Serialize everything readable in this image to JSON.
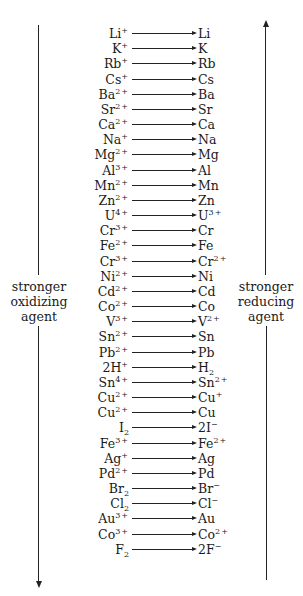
{
  "diagram": {
    "type": "reduction-potential-series",
    "left_axis": {
      "label_lines": [
        "stronger",
        "oxidizing",
        "agent"
      ],
      "direction": "down"
    },
    "right_axis": {
      "label_lines": [
        "stronger",
        "reducing",
        "agent"
      ],
      "direction": "up"
    },
    "reactions": [
      {
        "ox": "Li",
        "ox_sup": "+",
        "ox_sub": "",
        "red": "Li",
        "red_sup": "",
        "red_sub": ""
      },
      {
        "ox": "K",
        "ox_sup": "+",
        "ox_sub": "",
        "red": "K",
        "red_sup": "",
        "red_sub": ""
      },
      {
        "ox": "Rb",
        "ox_sup": "+",
        "ox_sub": "",
        "red": "Rb",
        "red_sup": "",
        "red_sub": ""
      },
      {
        "ox": "Cs",
        "ox_sup": "+",
        "ox_sub": "",
        "red": "Cs",
        "red_sup": "",
        "red_sub": ""
      },
      {
        "ox": "Ba",
        "ox_sup": "2+",
        "ox_sub": "",
        "red": "Ba",
        "red_sup": "",
        "red_sub": ""
      },
      {
        "ox": "Sr",
        "ox_sup": "2+",
        "ox_sub": "",
        "red": "Sr",
        "red_sup": "",
        "red_sub": ""
      },
      {
        "ox": "Ca",
        "ox_sup": "2+",
        "ox_sub": "",
        "red": "Ca",
        "red_sup": "",
        "red_sub": ""
      },
      {
        "ox": "Na",
        "ox_sup": "+",
        "ox_sub": "",
        "red": "Na",
        "red_sup": "",
        "red_sub": ""
      },
      {
        "ox": "Mg",
        "ox_sup": "2+",
        "ox_sub": "",
        "red": "Mg",
        "red_sup": "",
        "red_sub": ""
      },
      {
        "ox": "Al",
        "ox_sup": "3+",
        "ox_sub": "",
        "red": "Al",
        "red_sup": "",
        "red_sub": ""
      },
      {
        "ox": "Mn",
        "ox_sup": "2+",
        "ox_sub": "",
        "red": "Mn",
        "red_sup": "",
        "red_sub": ""
      },
      {
        "ox": "Zn",
        "ox_sup": "2+",
        "ox_sub": "",
        "red": "Zn",
        "red_sup": "",
        "red_sub": ""
      },
      {
        "ox": "U",
        "ox_sup": "4+",
        "ox_sub": "",
        "red": "U",
        "red_sup": "3+",
        "red_sub": ""
      },
      {
        "ox": "Cr",
        "ox_sup": "3+",
        "ox_sub": "",
        "red": "Cr",
        "red_sup": "",
        "red_sub": ""
      },
      {
        "ox": "Fe",
        "ox_sup": "2+",
        "ox_sub": "",
        "red": "Fe",
        "red_sup": "",
        "red_sub": ""
      },
      {
        "ox": "Cr",
        "ox_sup": "3+",
        "ox_sub": "",
        "red": "Cr",
        "red_sup": "2+",
        "red_sub": ""
      },
      {
        "ox": "Ni",
        "ox_sup": "2+",
        "ox_sub": "",
        "red": "Ni",
        "red_sup": "",
        "red_sub": ""
      },
      {
        "ox": "Cd",
        "ox_sup": "2+",
        "ox_sub": "",
        "red": "Cd",
        "red_sup": "",
        "red_sub": ""
      },
      {
        "ox": "Co",
        "ox_sup": "2+",
        "ox_sub": "",
        "red": "Co",
        "red_sup": "",
        "red_sub": ""
      },
      {
        "ox": "V",
        "ox_sup": "3+",
        "ox_sub": "",
        "red": "V",
        "red_sup": "2+",
        "red_sub": ""
      },
      {
        "ox": "Sn",
        "ox_sup": "2+",
        "ox_sub": "",
        "red": "Sn",
        "red_sup": "",
        "red_sub": ""
      },
      {
        "ox": "Pb",
        "ox_sup": "2+",
        "ox_sub": "",
        "red": "Pb",
        "red_sup": "",
        "red_sub": ""
      },
      {
        "ox": "2H",
        "ox_sup": "+",
        "ox_sub": "",
        "red": "H",
        "red_sup": "",
        "red_sub": "2"
      },
      {
        "ox": "Sn",
        "ox_sup": "4+",
        "ox_sub": "",
        "red": "Sn",
        "red_sup": "2+",
        "red_sub": ""
      },
      {
        "ox": "Cu",
        "ox_sup": "2+",
        "ox_sub": "",
        "red": "Cu",
        "red_sup": "+",
        "red_sub": ""
      },
      {
        "ox": "Cu",
        "ox_sup": "2+",
        "ox_sub": "",
        "red": "Cu",
        "red_sup": "",
        "red_sub": ""
      },
      {
        "ox": "I",
        "ox_sup": "",
        "ox_sub": "2",
        "red": "2I",
        "red_sup": "−",
        "red_sub": ""
      },
      {
        "ox": "Fe",
        "ox_sup": "3+",
        "ox_sub": "",
        "red": "Fe",
        "red_sup": "2+",
        "red_sub": ""
      },
      {
        "ox": "Ag",
        "ox_sup": "+",
        "ox_sub": "",
        "red": "Ag",
        "red_sup": "",
        "red_sub": ""
      },
      {
        "ox": "Pd",
        "ox_sup": "2+",
        "ox_sub": "",
        "red": "Pd",
        "red_sup": "",
        "red_sub": ""
      },
      {
        "ox": "Br",
        "ox_sup": "",
        "ox_sub": "2",
        "red": "Br",
        "red_sup": "−",
        "red_sub": ""
      },
      {
        "ox": "Cl",
        "ox_sup": "",
        "ox_sub": "2",
        "red": "Cl",
        "red_sup": "−",
        "red_sub": ""
      },
      {
        "ox": "Au",
        "ox_sup": "3+",
        "ox_sub": "",
        "red": "Au",
        "red_sup": "",
        "red_sub": ""
      },
      {
        "ox": "Co",
        "ox_sup": "3+",
        "ox_sub": "",
        "red": "Co",
        "red_sup": "2+",
        "red_sub": ""
      },
      {
        "ox": "F",
        "ox_sup": "",
        "ox_sub": "2",
        "red": "2F",
        "red_sup": "−",
        "red_sub": ""
      }
    ]
  }
}
